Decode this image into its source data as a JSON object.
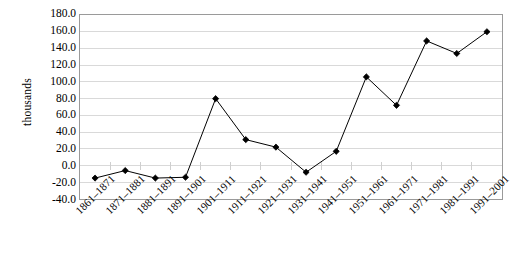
{
  "chart_data": {
    "type": "line",
    "title": "",
    "xlabel": "",
    "ylabel": "thousands",
    "ylim": [
      -40.0,
      180.0
    ],
    "ytick_step": 20.0,
    "grid": true,
    "legend": false,
    "marker": "diamond",
    "line_color": "#000000",
    "marker_color": "#000000",
    "grid_color": "#d9d9d9",
    "border_color": "#9a9a9a",
    "categories": [
      "1861–1871",
      "1871–1881",
      "1881–1891",
      "1891–1901",
      "1901–1911",
      "1911–1921",
      "1921–1931",
      "1931–1941",
      "1941–1951",
      "1951–1961",
      "1961–1971",
      "1971–1981",
      "1981–1991",
      "1991–2001"
    ],
    "values": [
      -15.0,
      -6.0,
      -15.0,
      -14.0,
      80.0,
      31.0,
      22.0,
      -8.0,
      17.0,
      106.0,
      72.0,
      149.0,
      134.0,
      160.0
    ],
    "ytick_labels": [
      "180.0",
      "160.0",
      "140.0",
      "120.0",
      "100.0",
      "80.0",
      "60.0",
      "40.0",
      "20.0",
      "0.0",
      "-20.0",
      "-40.0"
    ],
    "ytick_values": [
      180.0,
      160.0,
      140.0,
      120.0,
      100.0,
      80.0,
      60.0,
      40.0,
      20.0,
      0.0,
      -20.0,
      -40.0
    ]
  }
}
